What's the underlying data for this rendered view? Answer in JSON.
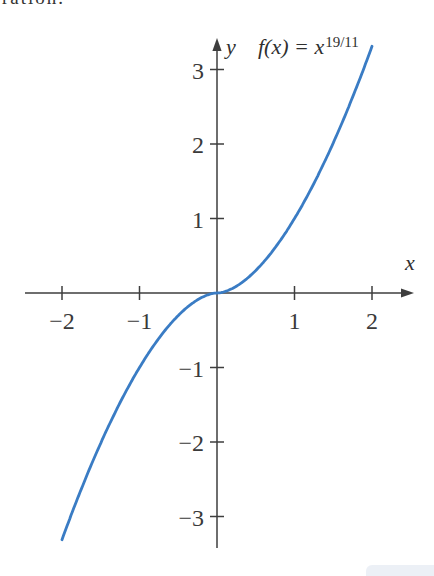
{
  "page": {
    "background": "#ffffff",
    "clipped_text_fragment": "ration.",
    "artifact_color": "#dde4ee"
  },
  "chart_data": {
    "type": "line",
    "title": "",
    "function_label": {
      "base": "f(x) = x",
      "exponent": "19/11"
    },
    "xlabel": "x",
    "ylabel": "y",
    "x_ticks": [
      -2,
      -1,
      1,
      2
    ],
    "y_ticks": [
      3,
      2,
      1,
      -1,
      -2,
      -3
    ],
    "xlim": [
      -2.48,
      2.54
    ],
    "ylim": [
      -3.42,
      3.42
    ],
    "grid": false,
    "axis_color": "#3e3e3e",
    "tick_label_color": "#3a3a3a",
    "series": [
      {
        "name": "f(x) = x^(19/11)",
        "kind": "power-function",
        "exponent_numerator": 19,
        "exponent_denominator": 11,
        "x_domain": [
          -2,
          2
        ],
        "color": "#3a7cc4",
        "key_points": [
          {
            "x": -2,
            "y": -3.31
          },
          {
            "x": -1,
            "y": -1
          },
          {
            "x": 0,
            "y": 0
          },
          {
            "x": 1,
            "y": 1
          },
          {
            "x": 2,
            "y": 3.31
          }
        ]
      }
    ]
  }
}
